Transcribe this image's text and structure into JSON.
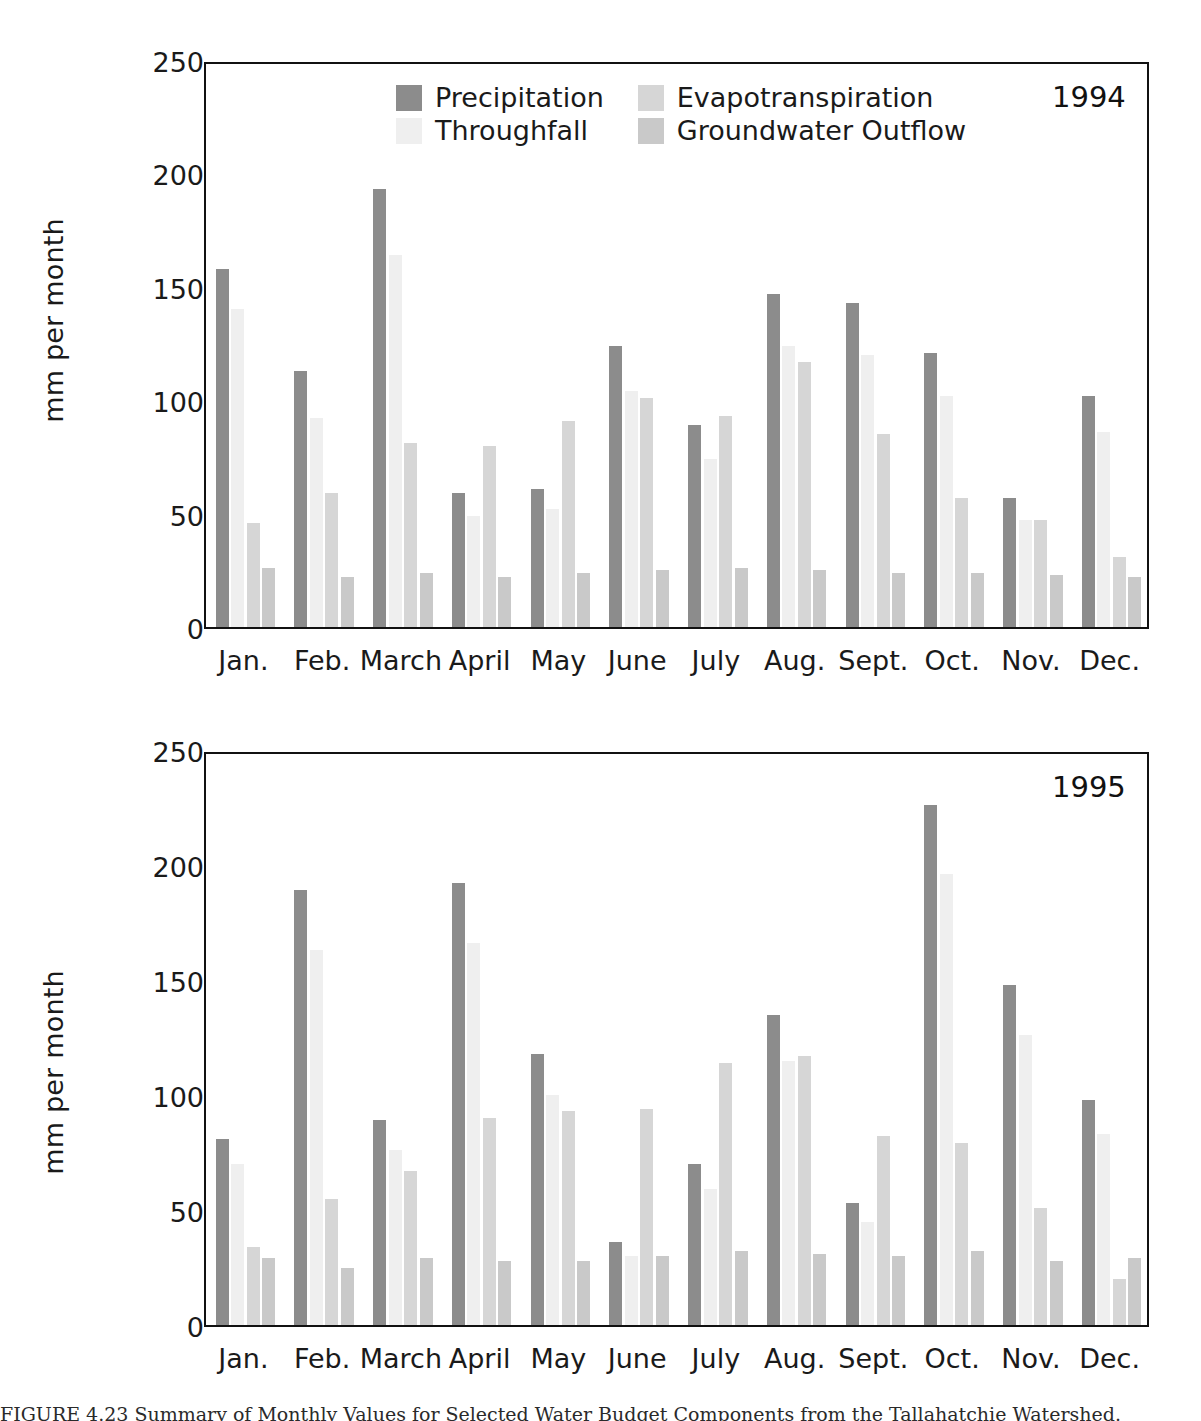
{
  "figure": {
    "caption": "FIGURE 4.23   Summary of Monthly Values for Selected Water Budget Components from the Tallahatchie Watershed.",
    "ylabel": "mm per month",
    "axis_label_color": "#1a1a1a"
  },
  "legend": {
    "items": [
      {
        "label": "Precipitation",
        "color": "#8c8c8c",
        "key": "precipitation"
      },
      {
        "label": "Evapotranspiration",
        "color": "#d6d6d6",
        "key": "evapotranspiration"
      },
      {
        "label": "Throughfall",
        "color": "#efefef",
        "key": "throughfall"
      },
      {
        "label": "Groundwater Outflow",
        "color": "#c9c9c9",
        "key": "groundwater_outflow"
      }
    ]
  },
  "yaxis": {
    "ticks": [
      "250",
      "200",
      "150",
      "100",
      "50",
      "0"
    ],
    "min": 0,
    "max": 250,
    "step": 50
  },
  "months": [
    "Jan.",
    "Feb.",
    "March",
    "April",
    "May",
    "June",
    "July",
    "Aug.",
    "Sept.",
    "Oct.",
    "Nov.",
    "Dec."
  ],
  "panels": [
    {
      "id": "panel-1994",
      "year": "1994"
    },
    {
      "id": "panel-1995",
      "year": "1995"
    }
  ],
  "chart_data": [
    {
      "type": "bar",
      "title": "1994",
      "xlabel": "",
      "ylabel": "mm per month",
      "ylim": [
        0,
        250
      ],
      "ytick_step": 50,
      "grid": false,
      "legend_position": "inside-top-center",
      "categories": [
        "Jan.",
        "Feb.",
        "March",
        "April",
        "May",
        "June",
        "July",
        "Aug.",
        "Sept.",
        "Oct.",
        "Nov.",
        "Dec."
      ],
      "series": [
        {
          "name": "Precipitation",
          "color": "#8c8c8c",
          "values": [
            158,
            113,
            193,
            59,
            61,
            124,
            89,
            147,
            143,
            121,
            57,
            102
          ]
        },
        {
          "name": "Throughfall",
          "color": "#efefef",
          "values": [
            140,
            92,
            164,
            49,
            52,
            104,
            74,
            124,
            120,
            102,
            47,
            86
          ]
        },
        {
          "name": "Evapotranspiration",
          "color": "#d6d6d6",
          "values": [
            46,
            59,
            81,
            80,
            91,
            101,
            93,
            117,
            85,
            57,
            47,
            31
          ]
        },
        {
          "name": "Groundwater Outflow",
          "color": "#c9c9c9",
          "values": [
            26,
            22,
            24,
            22,
            24,
            25,
            26,
            25,
            24,
            24,
            23,
            22
          ]
        }
      ]
    },
    {
      "type": "bar",
      "title": "1995",
      "xlabel": "",
      "ylabel": "mm per month",
      "ylim": [
        0,
        250
      ],
      "ytick_step": 50,
      "grid": false,
      "legend_position": "none",
      "categories": [
        "Jan.",
        "Feb.",
        "March",
        "April",
        "May",
        "June",
        "July",
        "Aug.",
        "Sept.",
        "Oct.",
        "Nov.",
        "Dec."
      ],
      "series": [
        {
          "name": "Precipitation",
          "color": "#8c8c8c",
          "values": [
            81,
            189,
            89,
            192,
            118,
            36,
            70,
            135,
            53,
            226,
            148,
            98
          ]
        },
        {
          "name": "Throughfall",
          "color": "#efefef",
          "values": [
            70,
            163,
            76,
            166,
            100,
            30,
            59,
            115,
            45,
            196,
            126,
            83
          ]
        },
        {
          "name": "Evapotranspiration",
          "color": "#d6d6d6",
          "values": [
            34,
            55,
            67,
            90,
            93,
            94,
            114,
            117,
            82,
            79,
            51,
            20
          ]
        },
        {
          "name": "Groundwater Outflow",
          "color": "#c9c9c9",
          "values": [
            29,
            25,
            29,
            28,
            28,
            30,
            32,
            31,
            30,
            32,
            28,
            29
          ]
        }
      ]
    }
  ]
}
